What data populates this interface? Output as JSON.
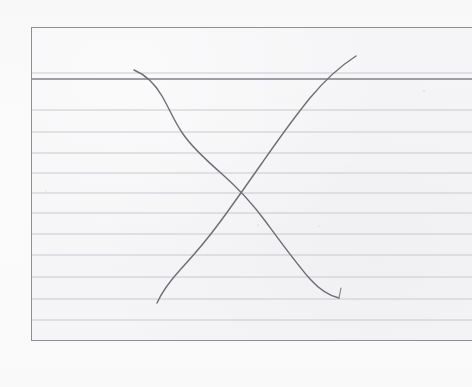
{
  "scene": {
    "title": "Hand-drawn crossing curves on a ruled index card",
    "background_color": "#fafafb",
    "width": 472,
    "height": 387
  },
  "card": {
    "name": "ruled index card",
    "paper_color": "#f5f5f7",
    "border_color": "#8e8e96",
    "rule_color": "#c3c4cb",
    "header_rule_color": "#7f8089",
    "left": 31,
    "top": 27,
    "width": 441,
    "height": 314,
    "rule_spacing": 21.3,
    "rule_count": 12,
    "header_rule_y": 79,
    "note": "right edge of card is cropped by the frame"
  },
  "drawing": {
    "ink_color": "#6f7077",
    "stroke_width": 1.45,
    "medium": "pencil",
    "shape": "two crossing curves forming an X",
    "intersection": {
      "x": 245,
      "y": 190
    },
    "curves": [
      {
        "name": "descending-curve",
        "direction": "down-right",
        "shape": "s-curve",
        "start": {
          "x": 134,
          "y": 70
        },
        "end": {
          "x": 340,
          "y": 298
        },
        "has_end_tick": true
      },
      {
        "name": "ascending-curve",
        "direction": "up-right",
        "shape": "concave-up",
        "start": {
          "x": 157,
          "y": 303
        },
        "end": {
          "x": 356,
          "y": 56
        },
        "has_end_tick": false
      }
    ]
  },
  "chart_data": {
    "type": "line",
    "subtitle": "Freehand sketch on a ruled index card",
    "xlabel": "",
    "ylabel": "",
    "xlim": [
      0,
      100
    ],
    "ylim": [
      0,
      100
    ],
    "grid": true,
    "grid_orientation": "horizontal",
    "legend": "none",
    "annotations": [
      {
        "text": "curves intersect near the card's centre",
        "x": 50,
        "y": 50
      }
    ],
    "series": [
      {
        "name": "descending-curve",
        "x": [
          0,
          8,
          14,
          20,
          27,
          34,
          41,
          48,
          55,
          63,
          72,
          81,
          90,
          100
        ],
        "y": [
          100,
          94,
          86,
          77,
          70,
          65,
          61,
          55,
          47,
          38,
          28,
          18,
          10,
          5
        ]
      },
      {
        "name": "ascending-curve",
        "x": [
          0,
          9,
          18,
          27,
          36,
          45,
          54,
          63,
          72,
          81,
          90,
          100
        ],
        "y": [
          3,
          9,
          17,
          25,
          34,
          43,
          52,
          62,
          72,
          82,
          92,
          100
        ]
      }
    ]
  }
}
